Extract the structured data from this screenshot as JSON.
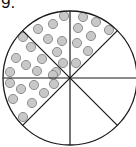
{
  "problem_number": "9.",
  "diagram": {
    "total_sectors": 8,
    "shaded_sectors": 4,
    "colors": {
      "stroke": "#1a1a1a",
      "dot_fill": "#c8c8c8",
      "dot_stroke": "#7a7a7a",
      "background": "#ffffff"
    },
    "sectors": [
      {
        "id": "top-right-upper",
        "dotted": true,
        "dot_count": 8
      },
      {
        "id": "top-left-upper",
        "dotted": true,
        "dot_count": 8
      },
      {
        "id": "left-upper",
        "dotted": true,
        "dot_count": 8
      },
      {
        "id": "left-lower",
        "dotted": true,
        "dot_count": 8
      },
      {
        "id": "bottom-left",
        "dotted": false,
        "dot_count": 0
      },
      {
        "id": "bottom-right",
        "dotted": false,
        "dot_count": 0
      },
      {
        "id": "right-lower",
        "dotted": false,
        "dot_count": 0
      },
      {
        "id": "right-upper",
        "dotted": false,
        "dot_count": 0
      }
    ]
  }
}
